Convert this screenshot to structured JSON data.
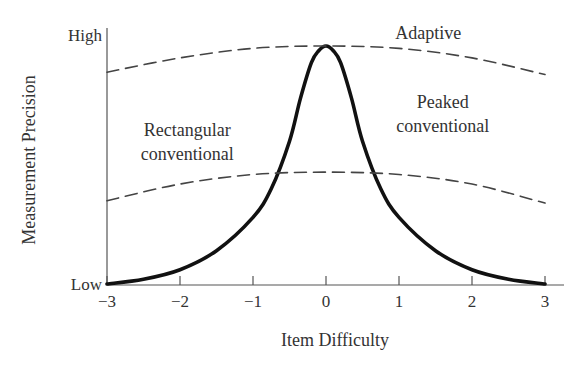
{
  "chart_data": {
    "type": "line",
    "title": "",
    "xlabel": "Item Difficulty",
    "ylabel": "Measurement Precision",
    "xlim": [
      -3,
      3
    ],
    "ylim": [
      0,
      1
    ],
    "x_ticks": [
      -3,
      -2,
      -1,
      0,
      1,
      2,
      3
    ],
    "x_tick_labels": [
      "−3",
      "−2",
      "−1",
      "0",
      "1",
      "2",
      "3"
    ],
    "y_tick_labels": {
      "low": "Low",
      "high": "High"
    },
    "grid": false,
    "legend": null,
    "series": [
      {
        "name": "Peaked conventional",
        "style": "solid",
        "x": [
          -3,
          -2.5,
          -2,
          -1.5,
          -1,
          -0.75,
          -0.5,
          -0.35,
          -0.2,
          -0.1,
          0,
          0.1,
          0.2,
          0.35,
          0.5,
          0.75,
          1,
          1.5,
          2,
          2.5,
          3
        ],
        "values": [
          0.0,
          0.02,
          0.06,
          0.14,
          0.28,
          0.4,
          0.6,
          0.78,
          0.93,
          0.98,
          1.0,
          0.98,
          0.93,
          0.78,
          0.6,
          0.4,
          0.28,
          0.14,
          0.06,
          0.02,
          0.0
        ]
      },
      {
        "name": "Adaptive",
        "style": "dashed",
        "x": [
          -3,
          -2,
          -1,
          0,
          1,
          2,
          3
        ],
        "values": [
          0.89,
          0.95,
          0.99,
          1.0,
          0.99,
          0.95,
          0.88
        ]
      },
      {
        "name": "Rectangular conventional",
        "style": "dashed",
        "x": [
          -3,
          -2,
          -1,
          0,
          1,
          2,
          3
        ],
        "values": [
          0.35,
          0.42,
          0.46,
          0.47,
          0.46,
          0.42,
          0.34
        ]
      }
    ],
    "annotations": [
      {
        "text": "Adaptive",
        "x": 1.4,
        "y": 1.03
      },
      {
        "text": "Peaked",
        "x": 1.6,
        "y": 0.74
      },
      {
        "text": "conventional",
        "x": 1.6,
        "y": 0.64
      },
      {
        "text": "Rectangular",
        "x": -1.9,
        "y": 0.62
      },
      {
        "text": "conventional",
        "x": -1.9,
        "y": 0.52
      }
    ]
  }
}
